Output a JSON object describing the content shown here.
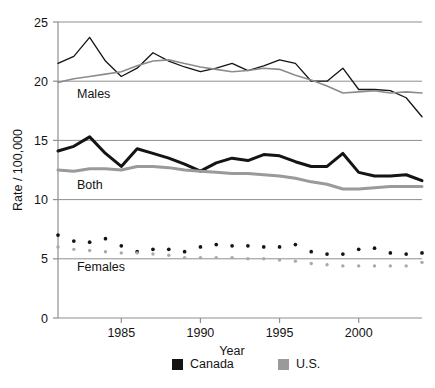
{
  "chart_data": {
    "type": "line",
    "title": "",
    "xlabel": "Year",
    "ylabel": "Rate / 100,000",
    "xlim": [
      1981,
      2004
    ],
    "ylim": [
      0,
      25
    ],
    "yticks": [
      0,
      5,
      10,
      15,
      20,
      25
    ],
    "ytick_labels": [
      "0",
      "5",
      "10",
      "15",
      "20",
      "25"
    ],
    "xticks": [
      1985,
      1990,
      1995,
      2000
    ],
    "xtick_labels": [
      "1985",
      "1990",
      "1995",
      "2000"
    ],
    "grid": "horizontal",
    "legend_position": "bottom",
    "x": [
      1981,
      1982,
      1983,
      1984,
      1985,
      1986,
      1987,
      1988,
      1989,
      1990,
      1991,
      1992,
      1993,
      1994,
      1995,
      1996,
      1997,
      1998,
      1999,
      2000,
      2001,
      2002,
      2003,
      2004
    ],
    "annotations": [
      {
        "text": "Males",
        "x": 1982.2,
        "y": 18.6
      },
      {
        "text": "Both",
        "x": 1982.2,
        "y": 10.9
      },
      {
        "text": "Females",
        "x": 1982.2,
        "y": 4.0
      }
    ],
    "groups": [
      {
        "name": "Males",
        "style": "line",
        "series": [
          {
            "name": "Canada",
            "color": "#141414",
            "width": 1.3,
            "values": [
              21.5,
              22.1,
              23.7,
              21.7,
              20.4,
              21.1,
              22.4,
              21.7,
              21.2,
              20.8,
              21.1,
              21.5,
              20.9,
              21.3,
              21.8,
              21.5,
              20.0,
              20.0,
              21.1,
              19.3,
              19.3,
              19.2,
              18.6,
              17.0
            ]
          },
          {
            "name": "U.S.",
            "color": "#8c8c8c",
            "width": 1.6,
            "values": [
              19.9,
              20.2,
              20.4,
              20.6,
              20.8,
              21.3,
              21.7,
              21.8,
              21.5,
              21.2,
              21.0,
              20.8,
              20.9,
              21.1,
              21.0,
              20.5,
              20.1,
              19.6,
              19.0,
              19.1,
              19.2,
              19.0,
              19.1,
              19.0
            ]
          }
        ]
      },
      {
        "name": "Both",
        "style": "line",
        "series": [
          {
            "name": "Canada",
            "color": "#141414",
            "width": 3.0,
            "values": [
              14.1,
              14.5,
              15.3,
              13.9,
              12.8,
              14.3,
              13.9,
              13.5,
              13.0,
              12.4,
              13.1,
              13.5,
              13.3,
              13.8,
              13.7,
              13.2,
              12.8,
              12.8,
              13.9,
              12.3,
              12.0,
              12.0,
              12.1,
              11.6
            ]
          },
          {
            "name": "U.S.",
            "color": "#9a9a9a",
            "width": 3.0,
            "values": [
              12.5,
              12.4,
              12.6,
              12.6,
              12.5,
              12.8,
              12.8,
              12.7,
              12.5,
              12.4,
              12.3,
              12.2,
              12.2,
              12.1,
              12.0,
              11.8,
              11.5,
              11.3,
              10.9,
              10.9,
              11.0,
              11.1,
              11.1,
              11.1
            ]
          }
        ]
      },
      {
        "name": "Females",
        "style": "dots",
        "series": [
          {
            "name": "Canada",
            "color": "#141414",
            "width": 2.6,
            "values": [
              7.0,
              6.5,
              6.4,
              6.7,
              6.1,
              5.6,
              5.8,
              5.8,
              5.6,
              6.0,
              6.2,
              6.1,
              6.1,
              6.0,
              6.0,
              6.2,
              5.6,
              5.4,
              5.4,
              5.8,
              5.9,
              5.5,
              5.4,
              5.5
            ]
          },
          {
            "name": "U.S.",
            "color": "#a9a9a9",
            "width": 2.3,
            "values": [
              6.0,
              5.8,
              5.7,
              5.6,
              5.5,
              5.5,
              5.4,
              5.3,
              5.1,
              5.1,
              5.1,
              5.1,
              5.0,
              5.0,
              4.9,
              4.8,
              4.6,
              4.5,
              4.4,
              4.4,
              4.4,
              4.4,
              4.4,
              4.7
            ]
          }
        ]
      }
    ],
    "legend": [
      {
        "label": "Canada",
        "color": "#141414",
        "swatch": "square"
      },
      {
        "label": "U.S.",
        "color": "#9a9a9a",
        "swatch": "square"
      }
    ]
  }
}
